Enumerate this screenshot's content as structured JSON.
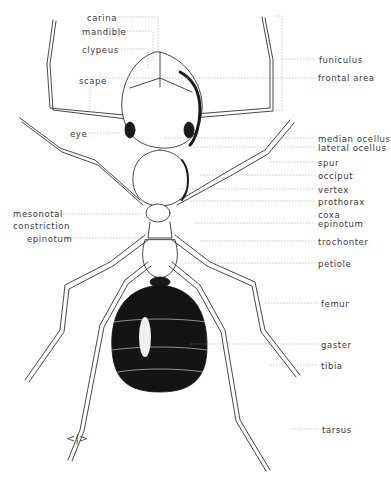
{
  "diagram": {
    "colors": {
      "ink": "#1a1a1a",
      "label": "#3a3a3a",
      "leader": "#9a9a9a",
      "background": "#ffffff"
    },
    "labels_left": [
      {
        "text": "carina",
        "x": 87,
        "y": 14
      },
      {
        "text": "mandible",
        "x": 82,
        "y": 28
      },
      {
        "text": "clypeus",
        "x": 82,
        "y": 46
      },
      {
        "text": "scape",
        "x": 79,
        "y": 77
      },
      {
        "text": "eye",
        "x": 70,
        "y": 130
      },
      {
        "text": "mesonotal",
        "x": 13,
        "y": 210
      },
      {
        "text": "constriction",
        "x": 13,
        "y": 222
      },
      {
        "text": "epinotum",
        "x": 27,
        "y": 235
      }
    ],
    "labels_right": [
      {
        "text": "funiculus",
        "x": 319,
        "y": 56
      },
      {
        "text": "frontal area",
        "x": 318,
        "y": 74
      },
      {
        "text": "median ocellus",
        "x": 318,
        "y": 135
      },
      {
        "text": "lateral ocellus",
        "x": 318,
        "y": 144
      },
      {
        "text": "spur",
        "x": 318,
        "y": 159
      },
      {
        "text": "occiput",
        "x": 318,
        "y": 172
      },
      {
        "text": "vertex",
        "x": 318,
        "y": 186
      },
      {
        "text": "prothorax",
        "x": 318,
        "y": 198
      },
      {
        "text": "coxa",
        "x": 318,
        "y": 211
      },
      {
        "text": "epinotum",
        "x": 318,
        "y": 220
      },
      {
        "text": "trochonter",
        "x": 318,
        "y": 238
      },
      {
        "text": "petiole",
        "x": 318,
        "y": 260
      },
      {
        "text": "femur",
        "x": 321,
        "y": 300
      },
      {
        "text": "gaster",
        "x": 321,
        "y": 341
      },
      {
        "text": "tibia",
        "x": 321,
        "y": 362
      },
      {
        "text": "tarsus",
        "x": 322,
        "y": 426
      }
    ],
    "signature_glyph": "†"
  }
}
